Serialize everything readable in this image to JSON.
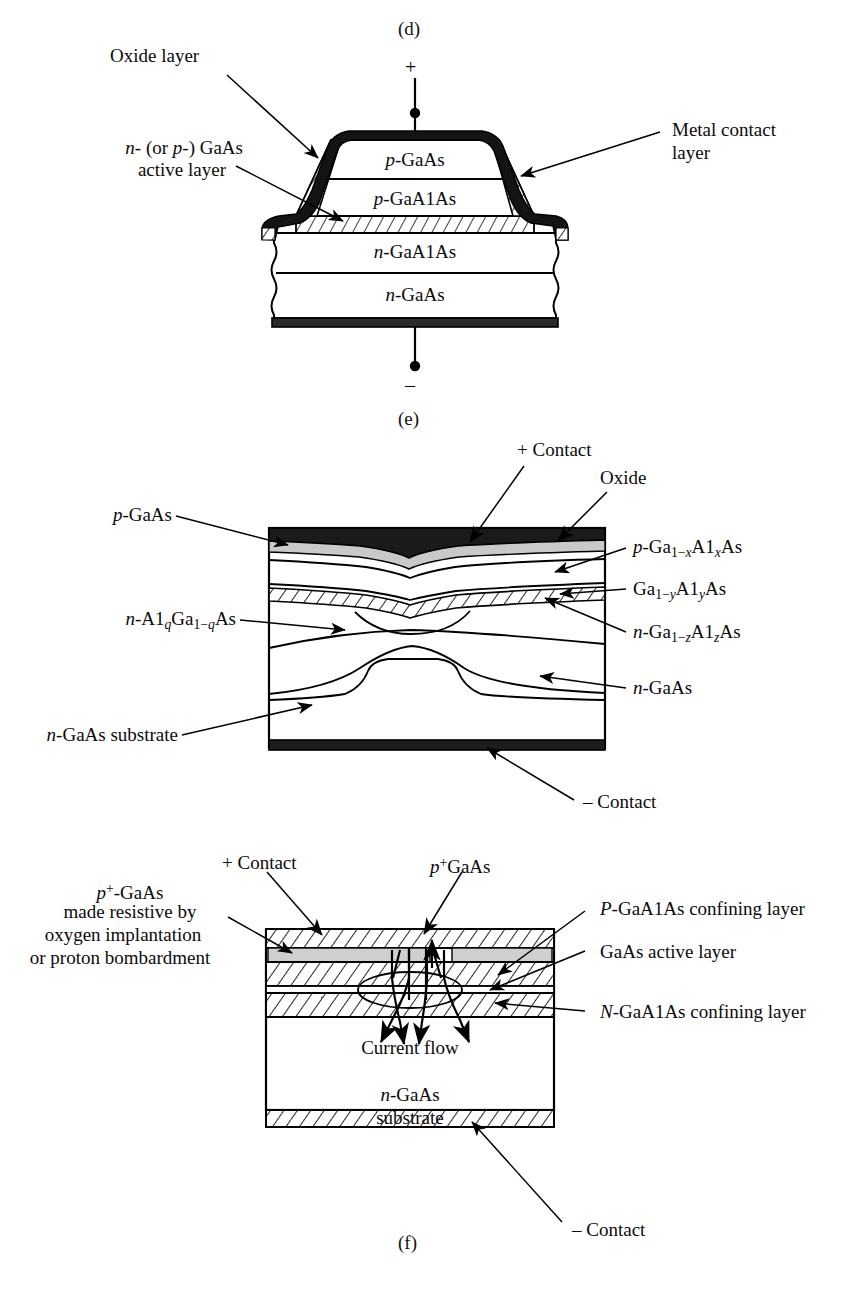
{
  "figure": {
    "panels": [
      {
        "tag": "(d)",
        "terminal_top": "+",
        "terminal_bottom": "–",
        "layers": [
          {
            "name": "p-GaAs",
            "prefix": "p",
            "body": "-GaAs"
          },
          {
            "name": "p-GaAlAs",
            "prefix": "p",
            "body": "-GaAlAs"
          },
          {
            "name": "n-GaAlAs",
            "prefix": "n",
            "body": "-GaAlAs"
          },
          {
            "name": "n-GaAs",
            "prefix": "n",
            "body": "-GaAs"
          }
        ],
        "callouts": [
          {
            "text": "Oxide layer",
            "side": "left"
          },
          {
            "text_line1": "n- (or p-) GaAs",
            "text_line2": "active layer",
            "side": "left"
          },
          {
            "text_line1": "Metal contact",
            "text_line2": "layer",
            "side": "right"
          }
        ]
      },
      {
        "tag": "(e)",
        "callouts_top": [
          {
            "text": "+ Contact"
          },
          {
            "text": "Oxide"
          }
        ],
        "callouts_left": [
          {
            "text": "p-GaAs"
          },
          {
            "text": "n-Al(q)Ga(1-q)As"
          },
          {
            "text": "n-GaAs substrate"
          }
        ],
        "callouts_right": [
          {
            "text": "p-Ga(1-x)Al(x)As"
          },
          {
            "text": "Ga(1-y)Al(y)As"
          },
          {
            "text": "n-Ga(1-z)Al(z)As"
          },
          {
            "text": "n-GaAs"
          }
        ],
        "callouts_bottom": [
          {
            "text": "– Contact"
          }
        ]
      },
      {
        "tag": "(f)",
        "callouts_top": [
          {
            "text": "+ Contact"
          },
          {
            "text": "p+GaAs"
          }
        ],
        "callouts_left": [
          {
            "line1": "p+-GaAs",
            "line2": "made resistive by",
            "line3": "oxygen implantation",
            "line4": "or proton bombardment"
          }
        ],
        "callouts_right": [
          {
            "text": "P-GaAlAs confining layer"
          },
          {
            "text": "GaAs active layer"
          },
          {
            "text": "N-GaAlAs confining layer"
          }
        ],
        "inner_labels": [
          {
            "text": "Current flow"
          },
          {
            "line1": "n-GaAs",
            "line2": "substrate"
          }
        ],
        "callouts_bottom": [
          {
            "text": "– Contact"
          }
        ]
      }
    ]
  },
  "colors": {
    "ink": "#000000",
    "oxide_dark": "#1a1a1a",
    "metal_gray": "#c9c9c9",
    "page_bg": "#ffffff"
  }
}
